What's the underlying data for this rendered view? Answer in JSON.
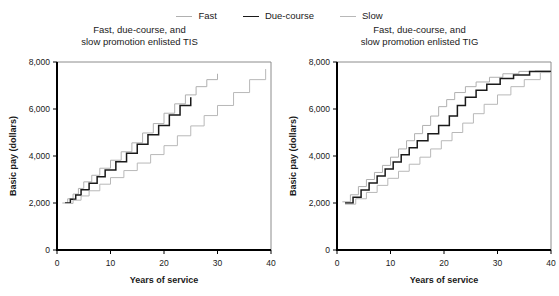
{
  "legend": {
    "position": "top-center",
    "entries": [
      {
        "label": "Fast",
        "color": "#b0b0b0",
        "width": 1.1
      },
      {
        "label": "Due-course",
        "color": "#1a1a1a",
        "width": 1.6
      },
      {
        "label": "Slow",
        "color": "#b8b8b8",
        "width": 1.1
      }
    ]
  },
  "colors": {
    "fast": "#b0b0b0",
    "due_course": "#1a1a1a",
    "slow": "#b8b8b8",
    "axis": "#000000",
    "frame": "#8c8c8c",
    "text": "#1a1a1a"
  },
  "panels": [
    {
      "id": "tis",
      "title_line1": "Fast, due-course, and",
      "title_line2": "slow promotion enlisted TIS"
    },
    {
      "id": "tig",
      "title_line1": "Fast, due-course, and",
      "title_line2": "slow promotion enlisted TIG"
    }
  ],
  "chart_data": [
    {
      "type": "line",
      "title": "Fast, due-course, and slow promotion enlisted TIS",
      "xlabel": "Years of service",
      "ylabel": "Basic pay (dollars)",
      "xlim": [
        0,
        40
      ],
      "ylim": [
        0,
        8000
      ],
      "xticks": [
        0,
        10,
        20,
        30,
        40
      ],
      "xtick_labels": [
        "0",
        "10",
        "20",
        "30",
        "40"
      ],
      "yticks": [
        0,
        2000,
        4000,
        6000,
        8000
      ],
      "ytick_labels": [
        "0",
        "2,000",
        "4,000",
        "6,000",
        "8,000"
      ],
      "grid": false,
      "legend_position": "top-center",
      "drawstyle": "steps-post",
      "series": [
        {
          "name": "Fast",
          "color": "#b0b0b0",
          "x": [
            1.0,
            2.0,
            3.0,
            4.0,
            5.0,
            6.5,
            8.0,
            10.0,
            12.0,
            14.0,
            16.0,
            18.0,
            20.0,
            22.0,
            24.0,
            26.0,
            28.0,
            30.0
          ],
          "y": [
            2000,
            2180,
            2380,
            2620,
            2900,
            3180,
            3480,
            3820,
            4180,
            4560,
            4980,
            5380,
            5820,
            6220,
            6600,
            6950,
            7250,
            7500
          ]
        },
        {
          "name": "Due-course",
          "color": "#1a1a1a",
          "x": [
            1.5,
            2.5,
            3.5,
            4.5,
            6.0,
            7.5,
            9.0,
            11.0,
            13.0,
            15.0,
            17.0,
            19.0,
            21.0,
            23.0,
            25.0
          ],
          "y": [
            2000,
            2160,
            2340,
            2560,
            2840,
            3120,
            3400,
            3760,
            4120,
            4500,
            4900,
            5300,
            5750,
            6150,
            6500
          ]
        },
        {
          "name": "Slow",
          "color": "#b8b8b8",
          "x": [
            1.5,
            3.0,
            4.5,
            6.0,
            8.0,
            10.0,
            12.5,
            15.0,
            17.5,
            20.0,
            22.5,
            25.0,
            27.5,
            30.0,
            33.0,
            36.0,
            39.0
          ],
          "y": [
            1980,
            2120,
            2300,
            2520,
            2800,
            3080,
            3380,
            3700,
            4060,
            4440,
            4860,
            5280,
            5720,
            6150,
            6700,
            7250,
            7700
          ]
        }
      ]
    },
    {
      "type": "line",
      "title": "Fast, due-course, and slow promotion enlisted TIG",
      "xlabel": "Years of service",
      "ylabel": "Basic pay (dollars)",
      "xlim": [
        0,
        40
      ],
      "ylim": [
        0,
        8000
      ],
      "xticks": [
        0,
        10,
        20,
        30,
        40
      ],
      "xtick_labels": [
        "0",
        "10",
        "20",
        "30",
        "40"
      ],
      "yticks": [
        0,
        2000,
        4000,
        6000,
        8000
      ],
      "ytick_labels": [
        "0",
        "2,000",
        "4,000",
        "6,000",
        "8,000"
      ],
      "grid": false,
      "legend_position": "top-center",
      "drawstyle": "steps-post",
      "series": [
        {
          "name": "Fast",
          "color": "#b0b0b0",
          "x": [
            1.0,
            2.5,
            4.0,
            5.5,
            7.0,
            8.5,
            10.0,
            11.5,
            13.0,
            14.5,
            16.0,
            17.5,
            19.0,
            20.5,
            22.0,
            24.0,
            26.0,
            28.5,
            31.0,
            34.0,
            37.0,
            40.0
          ],
          "y": [
            2050,
            2350,
            2700,
            3000,
            3300,
            3600,
            3950,
            4300,
            4650,
            4950,
            5300,
            5700,
            6100,
            6400,
            6700,
            6950,
            7150,
            7350,
            7500,
            7600,
            7620,
            7620
          ]
        },
        {
          "name": "Due-course",
          "color": "#1a1a1a",
          "x": [
            1.5,
            3.0,
            4.5,
            6.0,
            7.5,
            9.0,
            10.5,
            12.0,
            13.5,
            15.0,
            17.0,
            19.0,
            21.0,
            22.5,
            24.0,
            26.0,
            28.0,
            30.5,
            33.0,
            36.0,
            40.0
          ],
          "y": [
            2000,
            2250,
            2550,
            2850,
            3150,
            3450,
            3750,
            4050,
            4350,
            4650,
            4950,
            5300,
            5700,
            6150,
            6500,
            6800,
            7050,
            7300,
            7450,
            7600,
            7600
          ]
        },
        {
          "name": "Slow",
          "color": "#b8b8b8",
          "x": [
            1.5,
            3.5,
            5.5,
            7.5,
            9.5,
            11.5,
            13.5,
            15.5,
            17.5,
            19.5,
            21.5,
            23.5,
            25.5,
            27.5,
            30.0,
            32.5,
            35.0,
            38.0,
            40.0
          ],
          "y": [
            1950,
            2180,
            2450,
            2750,
            3050,
            3350,
            3650,
            3950,
            4300,
            4650,
            5000,
            5400,
            5800,
            6200,
            6600,
            6950,
            7250,
            7550,
            7580
          ]
        }
      ]
    }
  ]
}
